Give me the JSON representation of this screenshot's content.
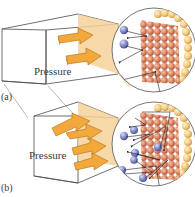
{
  "figure": {
    "panel_a": {
      "label": "(a)",
      "force_label": "Pressure",
      "inset": "magnified-wall-molecules"
    },
    "panel_b": {
      "label": "(b)",
      "force_label": "Pressure",
      "inset": "magnified-wall-molecules-compressed"
    }
  },
  "colors": {
    "box_line": "#4a4a4a",
    "arrow_fill": "#f2a83a",
    "arrow_edge": "#b06f14",
    "wall_tint": "#f6d19a",
    "wall_atom": "#d9805a",
    "wall_atom_highlight": "#f3b08c",
    "gas_molecule": "#7d84c4",
    "surface_atom": "#f2c778",
    "inset_border": "#555555"
  }
}
